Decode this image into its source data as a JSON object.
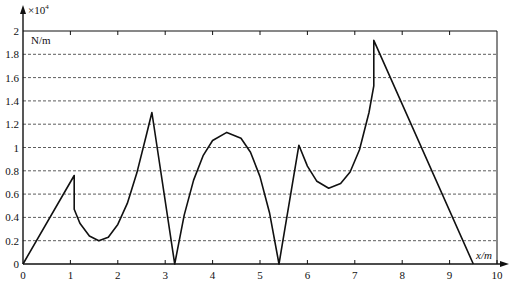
{
  "chart_data": {
    "type": "line",
    "title": "",
    "xlabel": "x/m",
    "ylabel": "N/m",
    "y_multiplier": "×10",
    "y_multiplier_exponent": "4",
    "xlim": [
      0,
      10
    ],
    "ylim": [
      0,
      2
    ],
    "grid": {
      "horizontal": true,
      "style": "dashed"
    },
    "x_ticks": [
      "0",
      "1",
      "2",
      "3",
      "4",
      "5",
      "6",
      "7",
      "8",
      "9",
      "10"
    ],
    "y_ticks": [
      "0",
      "0.2",
      "0.4",
      "0.6",
      "0.8",
      "1",
      "1.2",
      "1.4",
      "1.6",
      "1.8",
      "2"
    ],
    "series": [
      {
        "name": "distributed load",
        "color": "#111111",
        "points": [
          [
            0,
            0
          ],
          [
            1.08,
            0.76
          ],
          [
            1.08,
            0.47
          ],
          [
            1.2,
            0.35
          ],
          [
            1.4,
            0.24
          ],
          [
            1.6,
            0.2
          ],
          [
            1.8,
            0.23
          ],
          [
            2.0,
            0.34
          ],
          [
            2.2,
            0.52
          ],
          [
            2.4,
            0.78
          ],
          [
            2.6,
            1.1
          ],
          [
            2.72,
            1.3
          ],
          [
            3.2,
            0
          ],
          [
            3.4,
            0.42
          ],
          [
            3.6,
            0.72
          ],
          [
            3.8,
            0.93
          ],
          [
            4.0,
            1.06
          ],
          [
            4.3,
            1.13
          ],
          [
            4.6,
            1.08
          ],
          [
            4.8,
            0.96
          ],
          [
            5.0,
            0.75
          ],
          [
            5.2,
            0.44
          ],
          [
            5.4,
            0
          ],
          [
            5.82,
            1.02
          ],
          [
            6.0,
            0.84
          ],
          [
            6.2,
            0.71
          ],
          [
            6.45,
            0.65
          ],
          [
            6.7,
            0.69
          ],
          [
            6.9,
            0.79
          ],
          [
            7.1,
            0.98
          ],
          [
            7.3,
            1.3
          ],
          [
            7.4,
            1.53
          ],
          [
            7.4,
            1.92
          ],
          [
            9.5,
            0
          ]
        ]
      }
    ]
  }
}
